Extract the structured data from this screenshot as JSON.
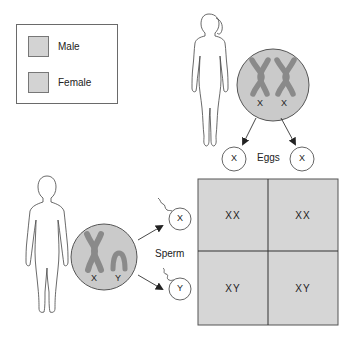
{
  "legend": {
    "items": [
      {
        "label": "Male",
        "color": "#d3d3d3"
      },
      {
        "label": "Female",
        "color": "#d3d3d3"
      }
    ]
  },
  "female": {
    "chromosome_labels": [
      "X",
      "X"
    ],
    "gametes_label": "Eggs",
    "gametes": [
      "X",
      "X"
    ]
  },
  "male": {
    "chromosome_labels": [
      "X",
      "Y"
    ],
    "gametes_label": "Sperm",
    "gametes": [
      "X",
      "Y"
    ]
  },
  "punnett_square": {
    "cells": [
      [
        "XX",
        "XX"
      ],
      [
        "XY",
        "XY"
      ]
    ],
    "fill_color": "#d6d6d6"
  },
  "colors": {
    "chromosome": "#8a8a8a",
    "nucleus_fill": "#cacaca",
    "outline": "#555555"
  }
}
